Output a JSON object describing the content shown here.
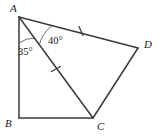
{
  "figure": {
    "type": "geometry-diagram",
    "width": 160,
    "height": 136,
    "background_color": "#ffffff",
    "line_color": "#3a3a3a",
    "arc_color": "#5a5a5a",
    "text_color": "#1a1a1a"
  },
  "vertices": [
    {
      "name": "A",
      "label": "A",
      "x": 19,
      "y": 17,
      "label_x": 10,
      "label_y": 12
    },
    {
      "name": "B",
      "label": "B",
      "x": 19,
      "y": 118,
      "label_x": 5,
      "label_y": 127
    },
    {
      "name": "C",
      "label": "C",
      "x": 93,
      "y": 118,
      "label_x": 97,
      "label_y": 130
    },
    {
      "name": "D",
      "label": "D",
      "x": 138,
      "y": 48,
      "label_x": 144,
      "label_y": 48
    }
  ],
  "edges": [
    {
      "name": "AB",
      "from": "A",
      "to": "B"
    },
    {
      "name": "BC",
      "from": "B",
      "to": "C"
    },
    {
      "name": "CD",
      "from": "C",
      "to": "D"
    },
    {
      "name": "DA",
      "from": "D",
      "to": "A"
    }
  ],
  "diagonal": {
    "name": "AC",
    "from": "A",
    "to": "C"
  },
  "angles": [
    {
      "name": "angle-BAC",
      "label": "35°",
      "value": 35,
      "unit": "degrees",
      "vertex": "A",
      "between": [
        "AB",
        "AC"
      ],
      "label_x": 18,
      "label_y": 55,
      "arc_radius": 26
    },
    {
      "name": "angle-CAD",
      "label": "40°",
      "value": 40,
      "unit": "degrees",
      "vertex": "A",
      "between": [
        "AC",
        "AD"
      ],
      "label_x": 48,
      "label_y": 44,
      "arc_radius": 34
    }
  ],
  "tick_marks": [
    {
      "name": "tick-on-AD",
      "segment": "AD",
      "count": 1,
      "x": 81,
      "y": 31
    },
    {
      "name": "tick-on-AC",
      "segment": "AC",
      "count": 1,
      "x": 56,
      "y": 69
    }
  ]
}
